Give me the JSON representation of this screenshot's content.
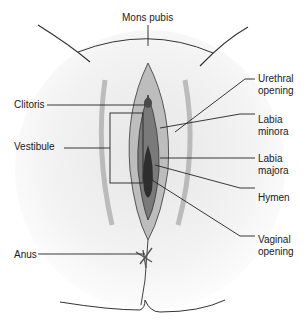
{
  "diagram": {
    "type": "anatomical-illustration",
    "style": "grayscale pencil-shaded medical drawing",
    "labels": [
      {
        "id": "mons-pubis",
        "text": "Mons pubis"
      },
      {
        "id": "clitoris",
        "text": "Clitoris"
      },
      {
        "id": "vestibule",
        "text": "Vestibule"
      },
      {
        "id": "urethral-opening",
        "text": "Urethral\nopening"
      },
      {
        "id": "labia-minora",
        "text": "Labia\nminora"
      },
      {
        "id": "labia-majora",
        "text": "Labia\nmajora"
      },
      {
        "id": "hymen",
        "text": "Hymen"
      },
      {
        "id": "vaginal-opening",
        "text": "Vaginal\nopening"
      },
      {
        "id": "anus",
        "text": "Anus"
      }
    ]
  }
}
